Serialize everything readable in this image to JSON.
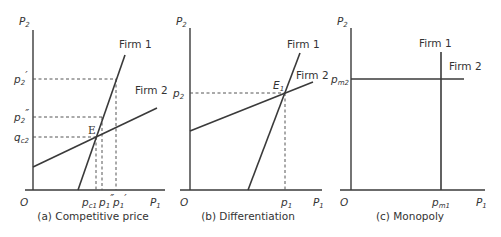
{
  "panels": [
    {
      "id": "a",
      "caption": "(a) Competitive price",
      "y_axis_label": "P",
      "y_axis_sub": "2",
      "x_axis_label": "P",
      "x_axis_sub": "1",
      "origin": "O",
      "curves": {
        "firm1": "Firm 1",
        "firm2": "Firm 2"
      },
      "point": "E",
      "y_ticks": [
        {
          "main": "p",
          "sub": "2",
          "sup": "′"
        },
        {
          "main": "p",
          "sub": "2",
          "sup": "″"
        },
        {
          "main": "q",
          "sub": "c2",
          "sup": ""
        }
      ],
      "x_ticks": [
        {
          "main": "p",
          "sub": "c1",
          "sup": ""
        },
        {
          "main": "p",
          "sub": "1",
          "sup": "″"
        },
        {
          "main": "p",
          "sub": "1",
          "sup": "′"
        }
      ]
    },
    {
      "id": "b",
      "caption": "(b) Differentiation",
      "y_axis_label": "P",
      "y_axis_sub": "2",
      "x_axis_label": "P",
      "x_axis_sub": "1",
      "origin": "O",
      "curves": {
        "firm1": "Firm 1",
        "firm2": "Firm 2"
      },
      "point": "E",
      "point_sub": "1",
      "y_ticks": [
        {
          "main": "p",
          "sub": "2",
          "sup": ""
        }
      ],
      "x_ticks": [
        {
          "main": "p",
          "sub": "1",
          "sup": ""
        }
      ]
    },
    {
      "id": "c",
      "caption": "(c) Monopoly",
      "y_axis_label": "P",
      "y_axis_sub": "2",
      "x_axis_label": "P",
      "x_axis_sub": "1",
      "origin": "O",
      "curves": {
        "firm1": "Firm 1",
        "firm2": "Firm 2"
      },
      "y_ticks": [
        {
          "main": "p",
          "sub": "m2",
          "sup": ""
        }
      ],
      "x_ticks": [
        {
          "main": "p",
          "sub": "m1",
          "sup": ""
        }
      ]
    }
  ]
}
